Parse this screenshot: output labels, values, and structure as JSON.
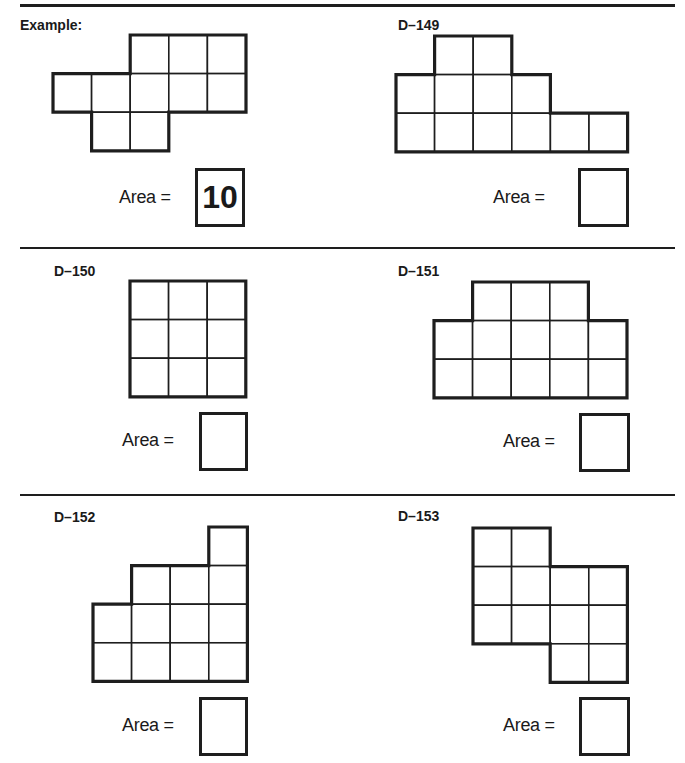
{
  "page": {
    "problems": [
      {
        "id": "example",
        "label": "Example:",
        "area_label": "Area =",
        "answer": "10",
        "shape_rows": [
          [
            3,
            4,
            5
          ],
          [
            1,
            2,
            3,
            4,
            5
          ],
          [
            2,
            3
          ]
        ]
      },
      {
        "id": "D-149",
        "label": "D–149",
        "area_label": "Area =",
        "answer": "",
        "shape_rows": [
          [
            2,
            3
          ],
          [
            1,
            2,
            3,
            4
          ],
          [
            1,
            2,
            3,
            4,
            5,
            6
          ]
        ]
      },
      {
        "id": "D-150",
        "label": "D–150",
        "area_label": "Area =",
        "answer": "",
        "shape_rows": [
          [
            1,
            2,
            3
          ],
          [
            1,
            2,
            3
          ],
          [
            1,
            2,
            3
          ]
        ]
      },
      {
        "id": "D-151",
        "label": "D–151",
        "area_label": "Area =",
        "answer": "",
        "shape_rows": [
          [
            2,
            3,
            4
          ],
          [
            1,
            2,
            3,
            4,
            5
          ],
          [
            1,
            2,
            3,
            4,
            5
          ]
        ]
      },
      {
        "id": "D-152",
        "label": "D–152",
        "area_label": "Area =",
        "answer": "",
        "shape_rows": [
          [
            4
          ],
          [
            2,
            3,
            4
          ],
          [
            1,
            2,
            3,
            4
          ],
          [
            1,
            2,
            3,
            4
          ]
        ]
      },
      {
        "id": "D-153",
        "label": "D–153",
        "area_label": "Area =",
        "answer": "",
        "shape_rows": [
          [
            1,
            2
          ],
          [
            1,
            2,
            3,
            4
          ],
          [
            1,
            2,
            3,
            4
          ],
          [
            3,
            4
          ]
        ]
      }
    ]
  }
}
